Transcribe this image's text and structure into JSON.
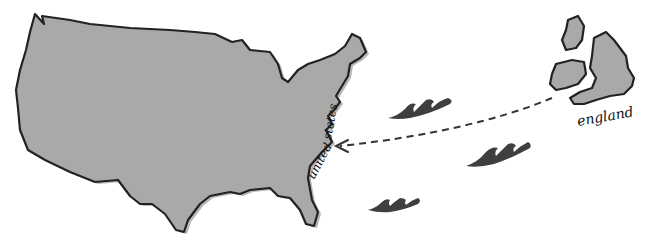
{
  "map": {
    "labels": {
      "usa_part1": "united",
      "usa_part2": "states",
      "uk": "england"
    },
    "regions": [
      {
        "name": "United States",
        "fill": "#a9a9a9"
      },
      {
        "name": "Great Britain",
        "fill": "#a9a9a9"
      },
      {
        "name": "Ireland",
        "fill": "#a9a9a9"
      },
      {
        "name": "Scotland islands",
        "fill": "#a9a9a9"
      }
    ],
    "route": {
      "from": "england",
      "to": "united states",
      "style": "dashed-arrow"
    },
    "decorations": {
      "waves_count": 3,
      "wave_color": "#3f3f3f"
    }
  }
}
